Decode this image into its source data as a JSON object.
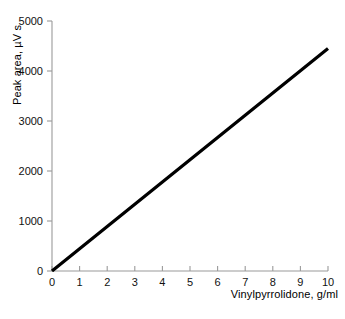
{
  "chart_data": {
    "type": "line",
    "title": "",
    "subtitle": "",
    "xlabel": "Vinylpyrrolidone, g/ml",
    "ylabel": "Peak area, µV s",
    "xlim": [
      0,
      10
    ],
    "ylim": [
      0,
      5000
    ],
    "xticks": [
      "0",
      "1",
      "2",
      "3",
      "4",
      "5",
      "6",
      "7",
      "8",
      "9",
      "10"
    ],
    "xtick_values": [
      0,
      1,
      2,
      3,
      4,
      5,
      6,
      7,
      8,
      9,
      10
    ],
    "yticks": [
      "0",
      "1000",
      "2000",
      "3000",
      "4000",
      "5000"
    ],
    "ytick_values": [
      0,
      1000,
      2000,
      3000,
      4000,
      5000
    ],
    "grid": false,
    "legend": false,
    "legend_position": "none",
    "markers": false,
    "line_color": "#000000",
    "axis_color": "#9a9a9a",
    "background_color": "#ffffff",
    "series": [
      {
        "name": "Calibration line",
        "color": "#000000",
        "x": [
          0,
          1,
          2,
          3,
          4,
          5,
          6,
          7,
          8,
          9,
          10
        ],
        "values": [
          0,
          445,
          890,
          1335,
          1780,
          2225,
          2670,
          3115,
          3560,
          4005,
          4450
        ]
      }
    ],
    "annotations": []
  },
  "axes": {
    "y_label_text": "Peak area, µV s",
    "x_label_text": "Vinylpyrrolidone, g/ml"
  }
}
